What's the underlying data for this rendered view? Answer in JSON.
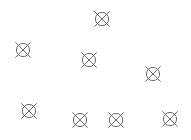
{
  "canvas": {
    "width": 191,
    "height": 140,
    "background_color": "#ffffff",
    "description": "Scattered crossed-circle symbols on a plain white background"
  },
  "symbol_style": {
    "name": "crossed-circle-symbol",
    "stroke_color": "#5a5a5a",
    "stroke_width": 0.9,
    "circle_radius": 6.6,
    "cross_arm_length": 10.5,
    "count": 8
  },
  "symbols": [
    {
      "id": 1,
      "label": "crossed-circle-1",
      "cx": 102,
      "cy": 19,
      "rotation": 0
    },
    {
      "id": 2,
      "label": "crossed-circle-2",
      "cx": 23,
      "cy": 50,
      "rotation": 0
    },
    {
      "id": 3,
      "label": "crossed-circle-3",
      "cx": 89,
      "cy": 60,
      "rotation": 0
    },
    {
      "id": 4,
      "label": "crossed-circle-4",
      "cx": 153,
      "cy": 74,
      "rotation": 0
    },
    {
      "id": 5,
      "label": "crossed-circle-5",
      "cx": 29,
      "cy": 111,
      "rotation": 0
    },
    {
      "id": 6,
      "label": "crossed-circle-6",
      "cx": 80,
      "cy": 120,
      "rotation": 0
    },
    {
      "id": 7,
      "label": "crossed-circle-7",
      "cx": 116,
      "cy": 120,
      "rotation": 0
    },
    {
      "id": 8,
      "label": "crossed-circle-8",
      "cx": 170,
      "cy": 119,
      "rotation": 0
    }
  ]
}
